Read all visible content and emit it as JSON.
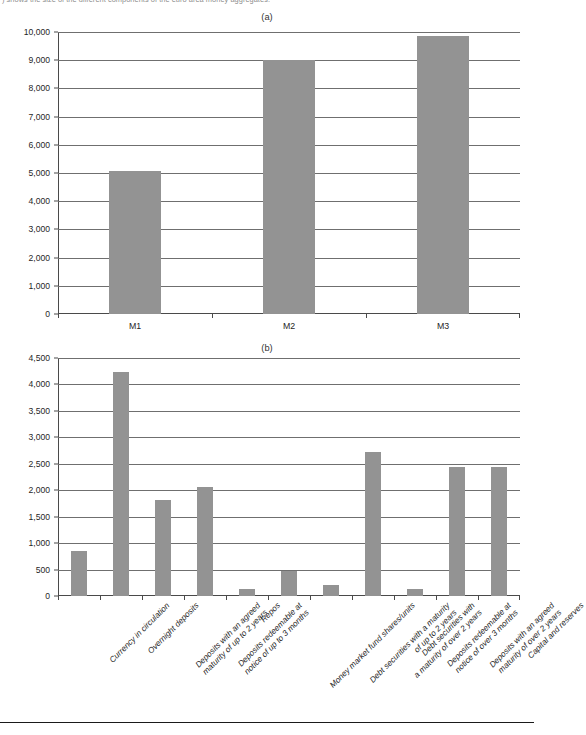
{
  "page": {
    "top_caption": ") shows the size of the different components of the euro area money aggregates.",
    "footer_rule": true
  },
  "panels": {
    "a": {
      "title": "(a)"
    },
    "b": {
      "title": "(b)"
    }
  },
  "chart_data": [
    {
      "id": "chart-a",
      "type": "bar",
      "title": "(a)",
      "xlabel": "",
      "ylabel": "",
      "ylim": [
        0,
        10000
      ],
      "ytick_labels": [
        "0",
        "1,000",
        "2,000",
        "3,000",
        "4,000",
        "5,000",
        "6,000",
        "7,000",
        "8,000",
        "9,000",
        "10,000"
      ],
      "ytick_values": [
        0,
        1000,
        2000,
        3000,
        4000,
        5000,
        6000,
        7000,
        8000,
        9000,
        10000
      ],
      "grid": true,
      "legend": "none",
      "bar_color": "#939393",
      "categories": [
        "M1",
        "M2",
        "M3"
      ],
      "values": [
        5060,
        9010,
        9850
      ]
    },
    {
      "id": "chart-b",
      "type": "bar",
      "title": "(b)",
      "xlabel": "",
      "ylabel": "",
      "ylim": [
        0,
        4500
      ],
      "ytick_labels": [
        "0",
        "500",
        "1,000",
        "1,500",
        "2,000",
        "2,500",
        "3,000",
        "3,500",
        "4,000",
        "4,500"
      ],
      "ytick_values": [
        0,
        500,
        1000,
        1500,
        2000,
        2500,
        3000,
        3500,
        4000,
        4500
      ],
      "grid": true,
      "legend": "none",
      "bar_color": "#939393",
      "categories": [
        "Currency in circulation",
        "Overnight deposits",
        "Deposits with an agreed\nmaturity of up to 2 years",
        "Deposits redeemable at\nnotice of up to 3 months",
        "Repos",
        "Money market fund shares/units",
        "Debt securities with a maturity\nof up to 2 years",
        "Debt securities with\na maturity of over 2 years",
        "Deposits redeemable at\nnotice of over 3 months",
        "Deposits with an agreed\nmaturity of over 2 years",
        "Capital and reserves"
      ],
      "values": [
        860,
        4230,
        1810,
        2070,
        130,
        480,
        200,
        2720,
        130,
        2430,
        2440
      ]
    }
  ]
}
